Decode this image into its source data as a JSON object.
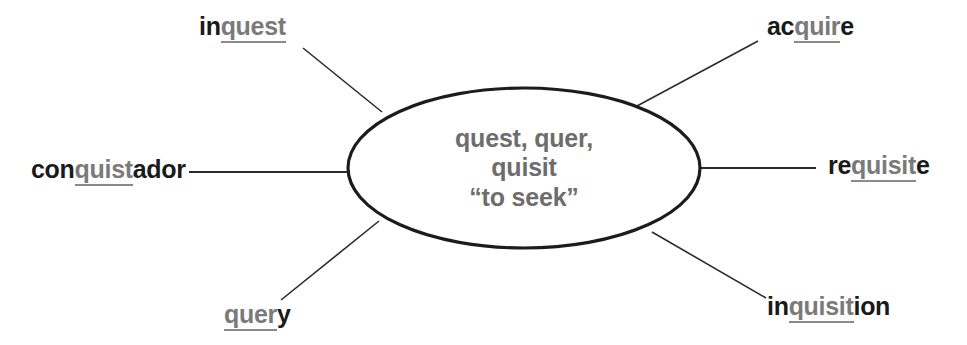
{
  "diagram": {
    "type": "word-root-web",
    "background_color": "#ffffff",
    "root_color": "#7a7a7a",
    "text_color": "#1a1a1a",
    "line_color": "#2b2b2b",
    "center": {
      "shape": "ellipse",
      "lines": [
        "quest, quer,",
        "quisit",
        "“to seek”"
      ],
      "roots": [
        "quest",
        "quer",
        "quisit"
      ],
      "meaning": "to seek"
    },
    "nodes": [
      {
        "id": "inquest",
        "word": "inquest",
        "prefix": "in",
        "root": "quest",
        "suffix": "",
        "position": "top-left"
      },
      {
        "id": "acquire",
        "word": "acquire",
        "prefix": "ac",
        "root": "quir",
        "suffix": "e",
        "position": "top-right"
      },
      {
        "id": "conquistador",
        "word": "conquistador",
        "prefix": "con",
        "root": "quist",
        "suffix": "ador",
        "position": "left"
      },
      {
        "id": "requisite",
        "word": "requisite",
        "prefix": "re",
        "root": "quisit",
        "suffix": "e",
        "position": "right"
      },
      {
        "id": "query",
        "word": "query",
        "prefix": "",
        "root": "quer",
        "suffix": "y",
        "position": "bottom-left"
      },
      {
        "id": "inquisition",
        "word": "inquisition",
        "prefix": "in",
        "root": "quisit",
        "suffix": "ion",
        "position": "bottom-right"
      }
    ]
  }
}
